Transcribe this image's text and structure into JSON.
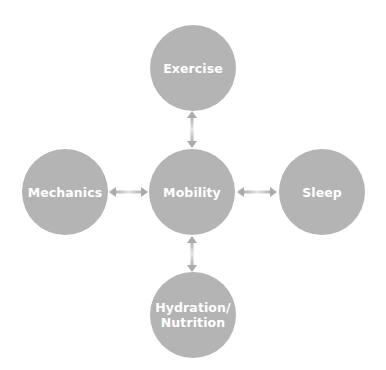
{
  "diagram": {
    "center": {
      "label": "Mobility"
    },
    "nodes": {
      "top": {
        "label": "Exercise"
      },
      "left": {
        "label": "Mechanics"
      },
      "right": {
        "label": "Sleep"
      },
      "bottom": {
        "label": "Hydration/\nNutrition"
      }
    },
    "connections": [
      {
        "from": "Mobility",
        "to": "Exercise",
        "type": "bidirectional"
      },
      {
        "from": "Mobility",
        "to": "Mechanics",
        "type": "bidirectional"
      },
      {
        "from": "Mobility",
        "to": "Sleep",
        "type": "bidirectional"
      },
      {
        "from": "Mobility",
        "to": "Hydration/Nutrition",
        "type": "bidirectional"
      }
    ],
    "colors": {
      "node_fill": "#b4b4b4",
      "node_text": "#ffffff",
      "arrow": "#b0b0b0",
      "background": "#ffffff"
    }
  }
}
